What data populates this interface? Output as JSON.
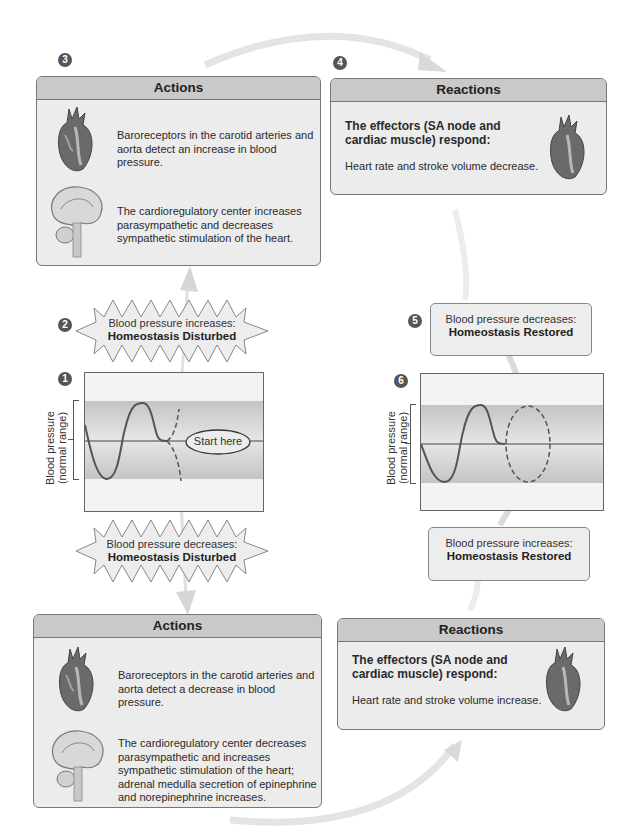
{
  "diagram": {
    "steps": {
      "s1": "1",
      "s2": "2",
      "s3": "3",
      "s4": "4",
      "s5": "5",
      "s6": "6"
    },
    "actions_top": {
      "header": "Actions",
      "text1": "Baroreceptors in the carotid arteries and aorta detect an increase in blood pressure.",
      "text2": "The cardioregulatory center increases parasympathetic and decreases sympathetic stimulation of the heart.",
      "icon1": "heart-icon",
      "icon2": "brain-icon"
    },
    "reactions_top": {
      "header": "Reactions",
      "bold": "The effectors (SA node and cardiac muscle) respond:",
      "text": "Heart rate and stroke volume decrease.",
      "icon": "heart-icon"
    },
    "burst_top": {
      "line1": "Blood pressure increases:",
      "line2": "Homeostasis Disturbed"
    },
    "burst_bottom": {
      "line1": "Blood pressure decreases:",
      "line2": "Homeostasis Disturbed"
    },
    "graph_left": {
      "ylabel1": "Blood pressure",
      "ylabel2": "(normal range)",
      "start_label": "Start here"
    },
    "graph_right": {
      "ylabel1": "Blood pressure",
      "ylabel2": "(normal range)"
    },
    "restored_top": {
      "line1": "Blood pressure decreases:",
      "line2": "Homeostasis Restored"
    },
    "restored_bottom": {
      "line1": "Blood pressure increases:",
      "line2": "Homeostasis Restored"
    },
    "actions_bottom": {
      "header": "Actions",
      "text1": "Baroreceptors in the carotid arteries and aorta detect a decrease in blood pressure.",
      "text2": "The cardioregulatory center decreases parasympathetic and increases sympathetic stimulation of the heart; adrenal medulla secretion of epinephrine and norepinephrine increases.",
      "icon1": "heart-icon",
      "icon2": "brain-icon"
    },
    "reactions_bottom": {
      "header": "Reactions",
      "bold": "The effectors (SA node and cardiac muscle) respond:",
      "text": "Heart rate and stroke volume increase.",
      "icon": "heart-icon"
    },
    "colors": {
      "panel_bg": "#ececec",
      "panel_header": "#c9c9c9",
      "border": "#777777",
      "band": "#c4c4c4",
      "arrow": "#e2e2e2",
      "step_badge": "#555555"
    }
  }
}
